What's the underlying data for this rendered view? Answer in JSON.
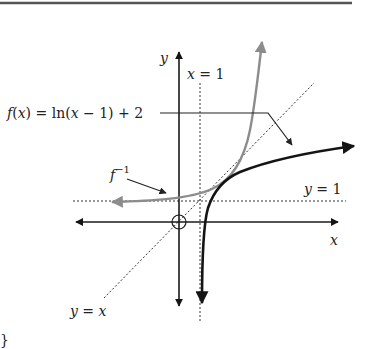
{
  "diagram": {
    "type": "function-inverse-graph",
    "labels": {
      "y_axis": "y",
      "x_axis": "x",
      "vertical_asymptote": "x = 1",
      "function": "f(x) = ln(x − 1) + 2",
      "function_prefix": "f(",
      "function_x": "x",
      "function_suffix": ") = ln(",
      "function_x2": "x",
      "function_tail": " − 1) + 2",
      "inverse": "f",
      "inverse_sup": "−1",
      "horizontal_asymptote": "y = 1",
      "identity_line": "y = x",
      "brace": "}"
    },
    "colors": {
      "axes": "#1a1a1a",
      "function_curve": "#141414",
      "inverse_curve": "#8c8c8c",
      "dotted": "#333333",
      "border": "#555555"
    }
  }
}
